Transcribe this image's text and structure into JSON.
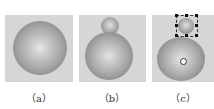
{
  "panels": [
    {
      "id": "a",
      "label": "（a）"
    },
    {
      "id": "b",
      "label": "（b）"
    },
    {
      "id": "c",
      "label": "（c）"
    }
  ]
}
